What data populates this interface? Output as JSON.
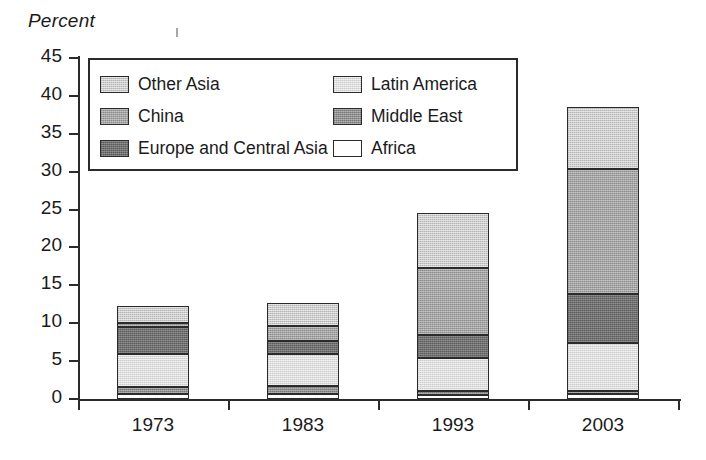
{
  "chart_data": {
    "type": "bar",
    "subtype": "stacked-bar",
    "title": "",
    "ylabel": "Percent",
    "xlabel": "",
    "categories": [
      "1973",
      "1983",
      "1993",
      "2003"
    ],
    "ylim": [
      0,
      45
    ],
    "y_ticks": [
      0,
      5,
      10,
      15,
      20,
      25,
      30,
      35,
      40,
      45
    ],
    "y_tick_labels": [
      "0",
      "5",
      "10",
      "15",
      "20",
      "25",
      "30",
      "35",
      "40",
      "45"
    ],
    "grid": false,
    "legend_position": "upper-left-inside",
    "stack_order_bottom_to_top": [
      "Africa",
      "Middle East",
      "Latin America",
      "Europe and Central Asia",
      "China",
      "Other Asia"
    ],
    "series": [
      {
        "name": "Africa",
        "values": [
          0.7,
          0.7,
          0.5,
          0.6
        ],
        "color": "#fefefe"
      },
      {
        "name": "Middle East",
        "values": [
          0.9,
          1.0,
          0.5,
          0.5
        ],
        "color": "#8f8f8f"
      },
      {
        "name": "Latin America",
        "values": [
          4.3,
          4.2,
          4.4,
          6.3
        ],
        "color": "#dcdcdc"
      },
      {
        "name": "Europe and Central Asia",
        "values": [
          3.6,
          1.8,
          3.0,
          6.4
        ],
        "color": "#6f6f6f"
      },
      {
        "name": "China",
        "values": [
          0.5,
          2.0,
          8.9,
          16.6
        ],
        "color": "#a3a3a3"
      },
      {
        "name": "Other Asia",
        "values": [
          2.3,
          3.0,
          7.3,
          8.2
        ],
        "color": "#c9c9c9"
      }
    ],
    "totals": [
      12.3,
      12.7,
      24.6,
      38.6
    ]
  },
  "axis": {
    "y_title": "Percent"
  },
  "legend": {
    "left_column": [
      {
        "label": "Other Asia",
        "swatch": "fill-other-asia"
      },
      {
        "label": "China",
        "swatch": "fill-china"
      },
      {
        "label": "Europe and Central Asia",
        "swatch": "fill-europe"
      }
    ],
    "right_column": [
      {
        "label": "Latin America",
        "swatch": "fill-latin"
      },
      {
        "label": "Middle East",
        "swatch": "fill-middle-east"
      },
      {
        "label": "Africa",
        "swatch": "fill-africa"
      }
    ]
  }
}
